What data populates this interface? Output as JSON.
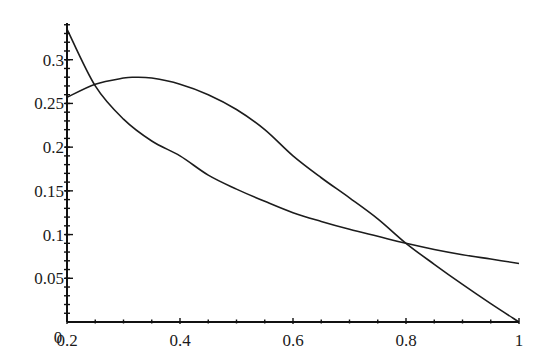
{
  "chart_data": {
    "type": "line",
    "title": "",
    "xlabel": "",
    "ylabel": "",
    "xlim": [
      0.2,
      1.0
    ],
    "ylim": [
      0,
      0.342
    ],
    "grid": false,
    "legend": null,
    "origin_label": "0",
    "x_ticks": [
      {
        "value": 0.2,
        "label": "0.2"
      },
      {
        "value": 0.4,
        "label": "0.4"
      },
      {
        "value": 0.6,
        "label": "0.6"
      },
      {
        "value": 0.8,
        "label": "0.8"
      },
      {
        "value": 1.0,
        "label": "1"
      }
    ],
    "y_ticks": [
      {
        "value": 0.05,
        "label": "0.05"
      },
      {
        "value": 0.1,
        "label": "0.1"
      },
      {
        "value": 0.15,
        "label": "0.15"
      },
      {
        "value": 0.2,
        "label": "0.2"
      },
      {
        "value": 0.25,
        "label": "0.25"
      },
      {
        "value": 0.3,
        "label": "0.3"
      }
    ],
    "series": [
      {
        "name": "decreasing curve",
        "x": [
          0.2,
          0.25,
          0.3,
          0.35,
          0.4,
          0.45,
          0.5,
          0.55,
          0.6,
          0.65,
          0.7,
          0.75,
          0.8,
          0.85,
          0.9,
          0.95,
          1.0
        ],
        "y": [
          0.335,
          0.27,
          0.232,
          0.207,
          0.19,
          0.168,
          0.152,
          0.138,
          0.125,
          0.115,
          0.106,
          0.098,
          0.09,
          0.083,
          0.077,
          0.072,
          0.067
        ]
      },
      {
        "name": "hump curve",
        "x": [
          0.2,
          0.25,
          0.3,
          0.32,
          0.35,
          0.4,
          0.45,
          0.5,
          0.55,
          0.6,
          0.65,
          0.7,
          0.75,
          0.8,
          0.85,
          0.9,
          0.95,
          1.0
        ],
        "y": [
          0.257,
          0.272,
          0.279,
          0.28,
          0.279,
          0.272,
          0.26,
          0.243,
          0.22,
          0.19,
          0.165,
          0.142,
          0.118,
          0.09,
          0.066,
          0.043,
          0.021,
          0.0
        ]
      }
    ],
    "intersections": [
      {
        "x": 0.235,
        "y": 0.27
      },
      {
        "x": 0.875,
        "y": 0.075
      }
    ]
  },
  "layout": {
    "plot_left_px": 67,
    "plot_right_px": 519,
    "plot_bottom_px": 322,
    "plot_top_px": 23,
    "minor_ticks_per_major_x": 3,
    "minor_ticks_per_major_y": 4
  }
}
